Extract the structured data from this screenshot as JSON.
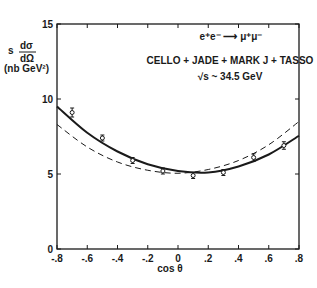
{
  "chart_data": {
    "type": "line",
    "title": "",
    "xlabel": "cos θ",
    "ylabel_lines": [
      "s dσ/dΩ",
      "(nb GeV²)"
    ],
    "ylabel_numerator": "dσ",
    "ylabel_denominator": "dΩ",
    "ylabel_prefix": "s",
    "ylabel_units": "(nb GeV²)",
    "xlim": [
      -0.8,
      0.8
    ],
    "ylim": [
      0,
      15
    ],
    "xticks": [
      -0.8,
      -0.6,
      -0.4,
      -0.2,
      0,
      0.2,
      0.4,
      0.6,
      0.8
    ],
    "xtick_labels": [
      "-.8",
      "-.6",
      "-.4",
      "-.2",
      "0",
      ".2",
      ".4",
      ".6",
      ".8"
    ],
    "yticks": [
      0,
      5,
      10,
      15
    ],
    "ytick_labels": [
      "0",
      "5",
      "10",
      "15"
    ],
    "grid": false,
    "annotations": {
      "reaction": "e⁺e⁻ ⟶ μ⁺μ⁻",
      "experiments": "CELLO + JADE + MARK J + TASSO",
      "energy": "√s ~ 34.5 GeV"
    },
    "series": [
      {
        "name": "data",
        "style": "points-with-errorbars",
        "x": [
          -0.7,
          -0.5,
          -0.3,
          -0.1,
          0.1,
          0.3,
          0.5,
          0.7
        ],
        "y": [
          9.1,
          7.4,
          5.9,
          5.2,
          4.9,
          5.1,
          6.1,
          6.9
        ],
        "err": [
          0.3,
          0.2,
          0.2,
          0.2,
          0.2,
          0.2,
          0.25,
          0.25
        ]
      },
      {
        "name": "fit (with asymmetry)",
        "style": "solid",
        "x": [
          -0.8,
          -0.6,
          -0.4,
          -0.2,
          0,
          0.2,
          0.4,
          0.6,
          0.8
        ],
        "y": [
          9.5,
          7.75,
          6.5,
          5.65,
          5.2,
          5.1,
          5.5,
          6.3,
          7.55
        ]
      },
      {
        "name": "QED (symmetric)",
        "style": "dashed",
        "x": [
          -0.8,
          -0.6,
          -0.4,
          -0.2,
          0,
          0.2,
          0.4,
          0.6,
          0.8
        ],
        "y": [
          8.3,
          6.8,
          5.8,
          5.25,
          5.05,
          5.3,
          5.9,
          6.95,
          8.5
        ]
      }
    ]
  }
}
